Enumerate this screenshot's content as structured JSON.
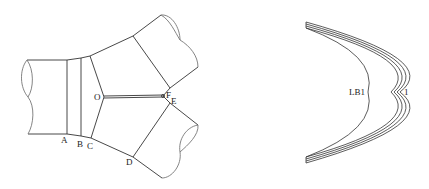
{
  "figures": {
    "left": {
      "description": "Three-pipe junction (Y-branch) with cutting lines",
      "labels": {
        "A": "A",
        "B": "B",
        "C": "C",
        "D": "D",
        "E": "E",
        "F": "F",
        "O": "O"
      }
    },
    "right": {
      "description": "Crescent-shaped layered curves",
      "labels": {
        "inner": "LB1",
        "outer": "1"
      }
    }
  },
  "colors": {
    "line": "#333333",
    "background": "#ffffff"
  }
}
